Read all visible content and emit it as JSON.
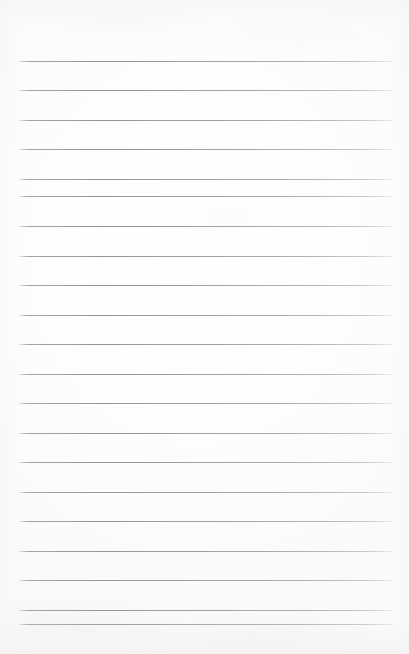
{
  "document": {
    "type": "ruled-notepad-page",
    "title": "Blank Lined Notepad Page",
    "content_text": "",
    "is_blank": true,
    "page_width": 409,
    "page_height": 654
  },
  "paper": {
    "background_color": "#fdfdfd",
    "edge_shade_color": "#f5f5f5"
  },
  "ruling": {
    "line_color": "#9a9a9d",
    "line_thickness": 1,
    "line_spacing": 29.6,
    "first_line_y": 61,
    "line_left_x": 19,
    "line_right_x": 392,
    "line_count": 20,
    "lines": [
      {
        "index": 1,
        "y": 61
      },
      {
        "index": 2,
        "y": 90
      },
      {
        "index": 3,
        "y": 120
      },
      {
        "index": 4,
        "y": 149
      },
      {
        "index": 5,
        "y": 179
      },
      {
        "index": 6,
        "y": 196
      },
      {
        "index": 7,
        "y": 226
      },
      {
        "index": 8,
        "y": 256
      },
      {
        "index": 9,
        "y": 285
      },
      {
        "index": 10,
        "y": 315
      },
      {
        "index": 11,
        "y": 344
      },
      {
        "index": 12,
        "y": 374
      },
      {
        "index": 13,
        "y": 403
      },
      {
        "index": 14,
        "y": 433
      },
      {
        "index": 15,
        "y": 462
      },
      {
        "index": 16,
        "y": 492
      },
      {
        "index": 17,
        "y": 521
      },
      {
        "index": 18,
        "y": 551
      },
      {
        "index": 19,
        "y": 580
      },
      {
        "index": 20,
        "y": 610
      },
      {
        "index": 21,
        "y": 624
      }
    ]
  }
}
